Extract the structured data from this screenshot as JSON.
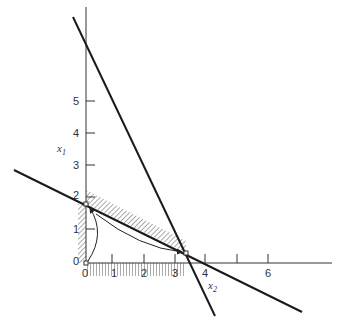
{
  "diagram": {
    "type": "linear-programming-feasible-region",
    "axes": {
      "horizontal": {
        "label": "x",
        "subscript": "2",
        "ticks": [
          "0",
          "1",
          "2",
          "3",
          "4",
          "",
          "6"
        ]
      },
      "vertical": {
        "label": "x",
        "subscript": "1",
        "ticks": [
          "0",
          "1",
          "2",
          "3",
          "4",
          "5"
        ]
      }
    },
    "lines": [
      {
        "name": "steep-constraint",
        "description": "steep line crossing x1-axis above 6 and x2-axis near 3.8"
      },
      {
        "name": "shallow-constraint",
        "description": "shallow line crossing x1-axis near 1.8 and x2-axis near 4"
      }
    ],
    "points": [
      {
        "name": "origin",
        "label": "0",
        "x2": 0,
        "x1": 0
      },
      {
        "name": "vertex-x1-intercept",
        "x2": 0,
        "x1": 1.8
      },
      {
        "name": "vertex-intersection",
        "x2": 3.1,
        "x1": 0.3
      }
    ],
    "arrows": [
      {
        "name": "path-origin-to-x1-intercept",
        "from": "origin",
        "to": "vertex-x1-intercept"
      },
      {
        "name": "path-x1-intercept-to-intersection",
        "from": "vertex-x1-intercept",
        "to": "vertex-intersection"
      }
    ],
    "colors": {
      "line": "#1a1a1a",
      "axis": "#333333",
      "hatch": "#555555"
    }
  }
}
